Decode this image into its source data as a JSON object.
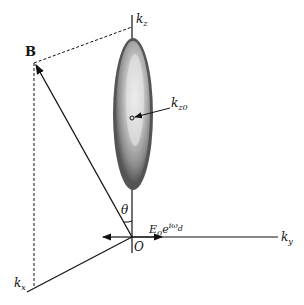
{
  "diagram": {
    "labels": {
      "B": "B",
      "kz": "k",
      "kz_sub": "z",
      "kz0": "k",
      "kz0_sub": "z0",
      "theta": "θ",
      "field": "E",
      "field_sub": "0",
      "field_exp": "e",
      "field_sup": "iω",
      "field_sup_sub": "d",
      "origin": "O",
      "ky": "k",
      "ky_sub": "y",
      "kx": "k",
      "kx_sub": "x"
    },
    "colors": {
      "line": "#111111",
      "ellipse_outer": "#3a3a3a",
      "ellipse_mid": "#8a8a8a",
      "ellipse_inner": "#dcdcdc"
    }
  }
}
